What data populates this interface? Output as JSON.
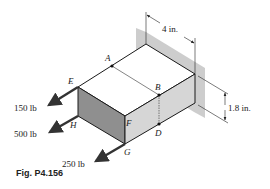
{
  "figure": {
    "caption": "Fig. P4.156",
    "points": {
      "A": "A",
      "B": "B",
      "D": "D",
      "E": "E",
      "F": "F",
      "G": "G",
      "H": "H"
    },
    "dimensions": {
      "width": "4 in.",
      "height": "1.8 in."
    },
    "forces": [
      {
        "label": "150 lb",
        "at": "E"
      },
      {
        "label": "500 lb",
        "at": "H"
      },
      {
        "label": "250 lb",
        "at": "G"
      }
    ],
    "colors": {
      "wall": "#bdbdbd",
      "front_face": "#8c8c8c",
      "side_face": "#d4d4d4",
      "top_face": "#ffffff",
      "edge": "#1a1a1a",
      "arrow": "#333333"
    }
  }
}
